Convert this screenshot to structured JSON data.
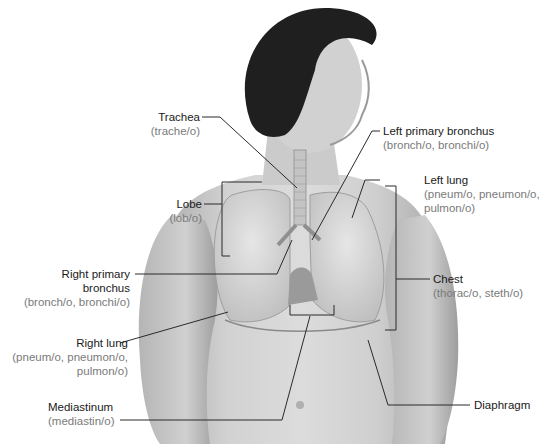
{
  "figure": {
    "colors": {
      "background": "#ffffff",
      "skin": "#c9c9c9",
      "hair": "#1f1f1f",
      "lung": "#d8d8d8",
      "leader_line": "#2a2a2a",
      "term_text": "#1a1a1a",
      "root_text": "#7a7a7a"
    }
  },
  "labels": {
    "trachea": {
      "term": "Trachea",
      "root": "(trache/o)"
    },
    "left_primary_bronchus": {
      "term": "Left primary bronchus",
      "root": "(bronch/o, bronchi/o)"
    },
    "left_lung": {
      "term": "Left lung",
      "root1": "(pneum/o, pneumon/o,",
      "root2": "pulmon/o)"
    },
    "lobe": {
      "term": "Lobe",
      "root": "(lob/o)"
    },
    "chest": {
      "term": "Chest",
      "root": "(thorac/o, steth/o)"
    },
    "right_primary_bronchus": {
      "term1": "Right primary",
      "term2": "bronchus",
      "root": "(bronch/o, bronchi/o)"
    },
    "right_lung": {
      "term": "Right lung",
      "root1": "(pneum/o, pneumon/o,",
      "root2": "pulmon/o)"
    },
    "mediastinum": {
      "term": "Mediastinum",
      "root": "(mediastin/o)"
    },
    "diaphragm": {
      "term": "Diaphragm"
    }
  }
}
